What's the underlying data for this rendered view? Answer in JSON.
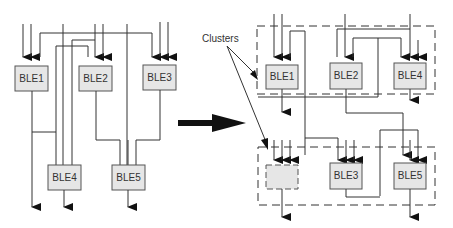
{
  "diagram": {
    "left": {
      "blocks": [
        {
          "id": "ble1",
          "label": "BLE1"
        },
        {
          "id": "ble2",
          "label": "BLE2"
        },
        {
          "id": "ble3",
          "label": "BLE3"
        },
        {
          "id": "ble4",
          "label": "BLE4"
        },
        {
          "id": "ble5",
          "label": "BLE5"
        }
      ]
    },
    "right": {
      "clusters_label": "Clusters",
      "cluster_top": [
        {
          "id": "ble1",
          "label": "BLE1"
        },
        {
          "id": "ble2",
          "label": "BLE2"
        },
        {
          "id": "ble4",
          "label": "BLE4"
        }
      ],
      "cluster_bottom": [
        {
          "id": "empty",
          "label": ""
        },
        {
          "id": "ble3",
          "label": "BLE3"
        },
        {
          "id": "ble5",
          "label": "BLE5"
        }
      ]
    },
    "colors": {
      "block_fill": "#e6e6e6",
      "line": "#333333"
    }
  }
}
